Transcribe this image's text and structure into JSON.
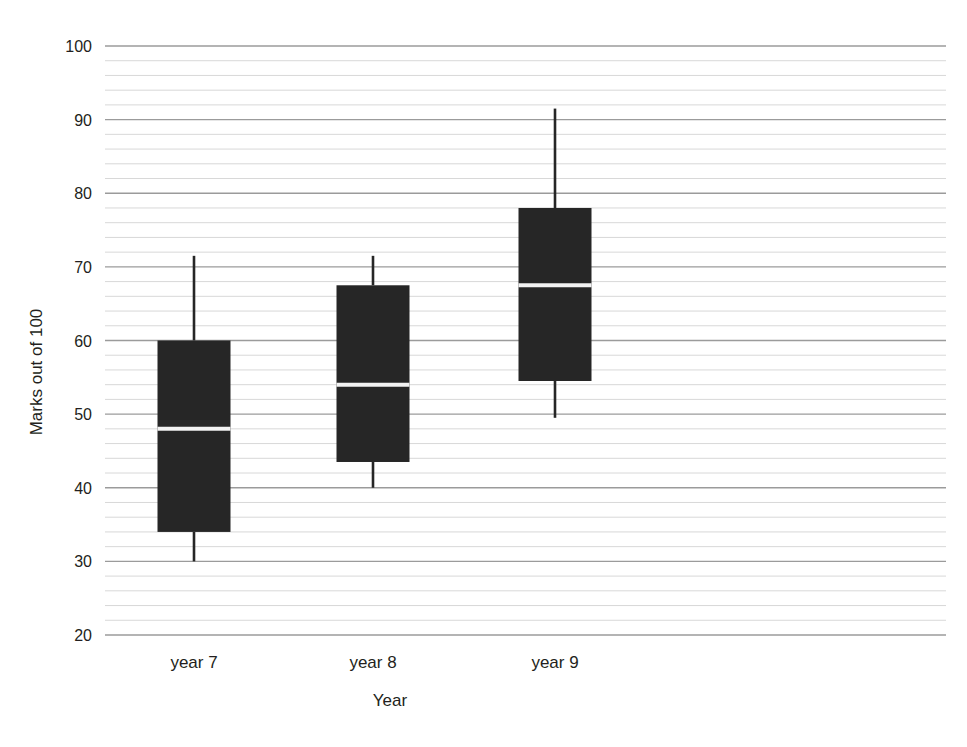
{
  "chart_data": {
    "type": "box",
    "title": "",
    "xlabel": "Year",
    "ylabel": "Marks out of 100",
    "categories": [
      "year 7",
      "year 8",
      "year 9"
    ],
    "ylim": [
      20,
      100
    ],
    "y_major_step": 10,
    "y_minor_step": 2,
    "grid": true,
    "legend": "none",
    "y_ticks": [
      20,
      30,
      40,
      50,
      60,
      70,
      80,
      90,
      100
    ],
    "box_color": "#262626",
    "median_color": "#f2f2f2",
    "gridline_major_color": "#9b9b9b",
    "gridline_minor_color": "#d8d8d8",
    "boxes": [
      {
        "category": "year 7",
        "min": 30,
        "q1": 34,
        "median": 48,
        "q3": 60,
        "max": 71.5
      },
      {
        "category": "year 8",
        "min": 40,
        "q1": 43.5,
        "median": 54,
        "q3": 67.5,
        "max": 71.5
      },
      {
        "category": "year 9",
        "min": 49.5,
        "q1": 54.5,
        "median": 67.5,
        "q3": 78,
        "max": 91.5
      }
    ]
  },
  "axis": {
    "y_title": "Marks out of 100",
    "x_title": "Year",
    "y_tick_labels": [
      "100",
      "90",
      "80",
      "70",
      "60",
      "50",
      "40",
      "30",
      "20"
    ],
    "x_tick_labels": [
      "year 7",
      "year 8",
      "year 9"
    ]
  }
}
